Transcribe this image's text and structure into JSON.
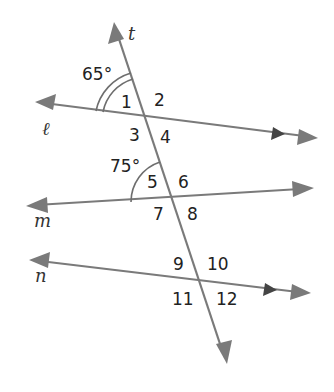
{
  "diagram": {
    "lines": {
      "t": {
        "label": "t"
      },
      "l": {
        "label": "ℓ"
      },
      "m": {
        "label": "m"
      },
      "n": {
        "label": "n"
      }
    },
    "given_angles": {
      "a1": {
        "label": "65°"
      },
      "a2": {
        "label": "75°"
      }
    },
    "angle_labels": [
      "1",
      "2",
      "3",
      "4",
      "5",
      "6",
      "7",
      "8",
      "9",
      "10",
      "11",
      "12"
    ],
    "colors": {
      "line": "#7a7a7a",
      "text": "#222222",
      "parallel_marker": "#444444"
    }
  }
}
